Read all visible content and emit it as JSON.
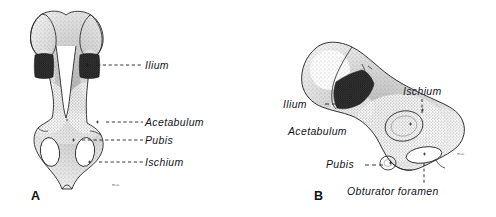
{
  "figure": {
    "type": "anatomical-illustration",
    "background_color": "#ffffff",
    "ink_color": "#1a1a1a",
    "stipple_color": "#6e6e6e",
    "cartilage_color": "#2b2b2b"
  },
  "panels": [
    {
      "id": "A",
      "letter": "A",
      "view": "anterior view of both hip bones",
      "signature": "m.u.",
      "labels": [
        {
          "id": "ilium",
          "text": "Ilium",
          "x": 146,
          "y": 66,
          "leader": "dashed-horizontal-left"
        },
        {
          "id": "acetabulum",
          "text": "Acetabulum",
          "x": 146,
          "y": 123,
          "leader": "dashed-horizontal-left"
        },
        {
          "id": "pubis",
          "text": "Pubis",
          "x": 146,
          "y": 141,
          "leader": "dashed-horizontal-left"
        },
        {
          "id": "ischium",
          "text": "Ischium",
          "x": 146,
          "y": 163,
          "leader": "dashed-horizontal-left"
        }
      ]
    },
    {
      "id": "B",
      "letter": "B",
      "view": "lateral view of a single hip bone",
      "signature": "m.u.",
      "labels": [
        {
          "id": "ilium",
          "text": "Ilium",
          "x": 298,
          "y": 107,
          "leader": "dash-right"
        },
        {
          "id": "acetabulum",
          "text": "Acetabulum",
          "x": 294,
          "y": 134,
          "leader": "none"
        },
        {
          "id": "ischium",
          "text": "Ischium",
          "x": 412,
          "y": 94,
          "leader": "vertical-below"
        },
        {
          "id": "pubis",
          "text": "Pubis",
          "x": 337,
          "y": 167,
          "leader": "dash-right"
        },
        {
          "id": "obturator_foramen",
          "text": "Obturator foramen",
          "x": 350,
          "y": 191,
          "leader": "vertical-above"
        }
      ]
    }
  ]
}
